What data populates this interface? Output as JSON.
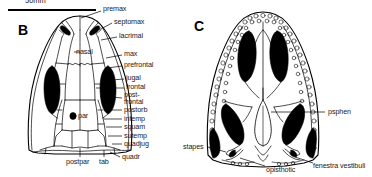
{
  "figure": {
    "scale": {
      "label": "50mm",
      "bar_length_px": 88
    },
    "panels": [
      {
        "id": "B",
        "letter": "B",
        "view": "dorsal skull roof"
      },
      {
        "id": "C",
        "letter": "C",
        "view": "palatal view"
      }
    ]
  },
  "panel_b": {
    "letter": "B",
    "labels": [
      {
        "name": "premax",
        "text": "premax"
      },
      {
        "name": "septomax",
        "text": "septomax"
      },
      {
        "name": "lacrimal",
        "text": "lacrimal"
      },
      {
        "name": "nasal",
        "text": "nasal"
      },
      {
        "name": "max",
        "text": "max"
      },
      {
        "name": "prefrontal",
        "text": "prefrontal"
      },
      {
        "name": "jugal",
        "text": "jugal"
      },
      {
        "name": "frontal",
        "text": "frontal"
      },
      {
        "name": "postfrontal_line1",
        "text": "post-"
      },
      {
        "name": "postfrontal_line2",
        "text": "frontal"
      },
      {
        "name": "postorb",
        "text": "postorb"
      },
      {
        "name": "intemp",
        "text": "intemp"
      },
      {
        "name": "squam",
        "text": "squam"
      },
      {
        "name": "sutemp",
        "text": "sutemp"
      },
      {
        "name": "quadjug",
        "text": "quadjug"
      },
      {
        "name": "quadr",
        "text": "quadr"
      },
      {
        "name": "par",
        "text": "par"
      },
      {
        "name": "postpar",
        "text": "postpar"
      },
      {
        "name": "tab",
        "text": "tab"
      }
    ]
  },
  "panel_c": {
    "letter": "C",
    "labels": [
      {
        "name": "psphen",
        "text": "psphen"
      },
      {
        "name": "stapes",
        "text": "stapes"
      },
      {
        "name": "opisthotic",
        "text": "opisthotic"
      },
      {
        "name": "fenestra-vestibuli",
        "text": "fenestra vestibuli"
      }
    ]
  },
  "colors": {
    "ink": "#000000",
    "fill": "#ffffff",
    "label_text": "#1a1a1a",
    "opening_fill": "#000000"
  }
}
